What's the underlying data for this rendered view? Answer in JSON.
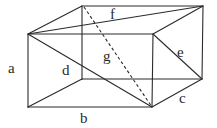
{
  "diagram": {
    "vertices": {
      "back_top_left": [
        82,
        6
      ],
      "back_top_right": [
        203,
        6
      ],
      "front_top_left": [
        28,
        34
      ],
      "front_top_right": [
        153,
        34
      ],
      "front_bottom_left": [
        28,
        107
      ],
      "front_bottom_right": [
        152,
        107
      ],
      "back_bottom_left": [
        82,
        79
      ],
      "back_bottom_right": [
        202,
        79
      ]
    },
    "labels": {
      "a": "a",
      "b": "b",
      "c": "c",
      "d": "d",
      "e": "e",
      "f": "f",
      "g": "g"
    },
    "label_meaning": {
      "a": "height (front-left vertical edge)",
      "b": "length (front-bottom edge)",
      "c": "width (bottom-right depth edge)",
      "d": "front face diagonal",
      "e": "right face diagonal",
      "f": "top face diagonal",
      "g": "space diagonal (dashed)"
    },
    "colors": {
      "line": "#2a2a2a",
      "background": "#ffffff"
    }
  }
}
